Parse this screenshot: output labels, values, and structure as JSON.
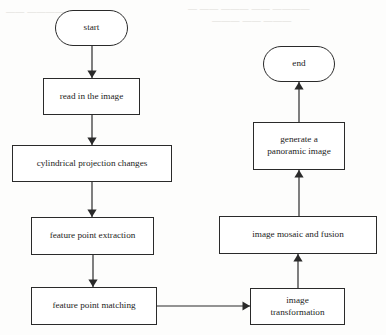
{
  "diagram": {
    "background_color": "#fdfdfc",
    "stroke_color": "#2a2a2a",
    "text_color": "#1d1d1d",
    "nodes": [
      {
        "id": "start",
        "label": "start",
        "shape": "terminal",
        "x": 55,
        "y": 10,
        "w": 73,
        "h": 36
      },
      {
        "id": "read",
        "label": "read in the image",
        "shape": "process",
        "x": 43,
        "y": 78,
        "w": 97,
        "h": 37
      },
      {
        "id": "cylindrical",
        "label": "cylindrical projection changes",
        "shape": "process",
        "x": 12,
        "y": 145,
        "w": 160,
        "h": 37
      },
      {
        "id": "extraction",
        "label": "feature point extraction",
        "shape": "process",
        "x": 31,
        "y": 217,
        "w": 123,
        "h": 38
      },
      {
        "id": "matching",
        "label": "feature point matching",
        "shape": "process",
        "x": 31,
        "y": 287,
        "w": 126,
        "h": 38
      },
      {
        "id": "transformation",
        "label": "image\ntransformation",
        "shape": "process",
        "x": 250,
        "y": 288,
        "w": 95,
        "h": 37
      },
      {
        "id": "mosaic",
        "label": "image mosaic and fusion",
        "shape": "process",
        "x": 219,
        "y": 216,
        "w": 158,
        "h": 38
      },
      {
        "id": "panoramic",
        "label": "generate a\npanoramic image",
        "shape": "process",
        "x": 253,
        "y": 122,
        "w": 92,
        "h": 48
      },
      {
        "id": "end",
        "label": "end",
        "shape": "terminal",
        "x": 263,
        "y": 46,
        "w": 72,
        "h": 36
      }
    ],
    "edges": [
      {
        "id": "e1",
        "from": "start",
        "to": "read",
        "direction": "down"
      },
      {
        "id": "e2",
        "from": "read",
        "to": "cylindrical",
        "direction": "down"
      },
      {
        "id": "e3",
        "from": "cylindrical",
        "to": "extraction",
        "direction": "down"
      },
      {
        "id": "e4",
        "from": "extraction",
        "to": "matching",
        "direction": "down"
      },
      {
        "id": "e5",
        "from": "matching",
        "to": "transformation",
        "direction": "right"
      },
      {
        "id": "e6",
        "from": "transformation",
        "to": "mosaic",
        "direction": "up"
      },
      {
        "id": "e7",
        "from": "mosaic",
        "to": "panoramic",
        "direction": "up"
      },
      {
        "id": "e8",
        "from": "panoramic",
        "to": "end",
        "direction": "up"
      }
    ]
  },
  "artifacts": {
    "bleed_line_1": "— —— ——— —— ————",
    "bleed_line_2": "——— —— ———",
    "bleed_line_3": "——  ————  ———"
  }
}
